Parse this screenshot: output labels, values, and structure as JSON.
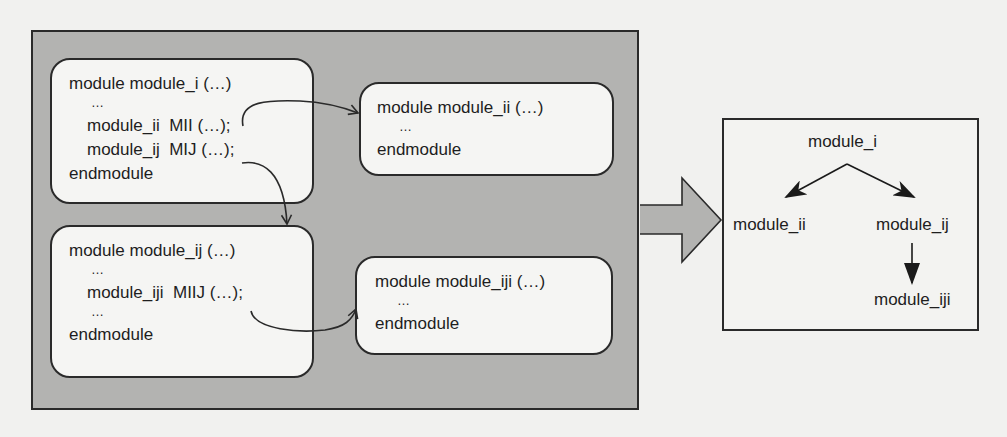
{
  "source_modules": {
    "module_i": {
      "lines": [
        "module module_i (…)",
        "…",
        "module_ii  MII (…);",
        "module_ij  MIJ (…);",
        "endmodule"
      ]
    },
    "module_ii": {
      "lines": [
        "module module_ii (…)",
        "…",
        "endmodule"
      ]
    },
    "module_ij": {
      "lines": [
        "module module_ij (…)",
        "…",
        "module_iji  MIIJ (…);",
        "…",
        "endmodule"
      ]
    },
    "module_iji": {
      "lines": [
        "module module_iji (…)",
        "…",
        "endmodule"
      ]
    }
  },
  "instantiation_links": [
    {
      "from": "module_i.MII",
      "to": "module_ii"
    },
    {
      "from": "module_i.MIJ",
      "to": "module_ij"
    },
    {
      "from": "module_ij.MIIJ",
      "to": "module_iji"
    }
  ],
  "transform_arrow": {
    "icon": "right-block-arrow-icon"
  },
  "hierarchy_tree": {
    "root": "module_i",
    "nodes": [
      "module_i",
      "module_ii",
      "module_ij",
      "module_iji"
    ],
    "edges": [
      {
        "from": "module_i",
        "to": "module_ii"
      },
      {
        "from": "module_i",
        "to": "module_ij"
      },
      {
        "from": "module_ij",
        "to": "module_iji"
      }
    ],
    "labels": {
      "root": "module_i",
      "left_child": "module_ii",
      "right_child": "module_ij",
      "grandchild": "module_iji"
    }
  },
  "colors": {
    "panel_fill": "#b3b3b1",
    "box_fill": "#f5f5f3",
    "stroke": "#2a2a2a",
    "background": "#f1f1ef"
  }
}
